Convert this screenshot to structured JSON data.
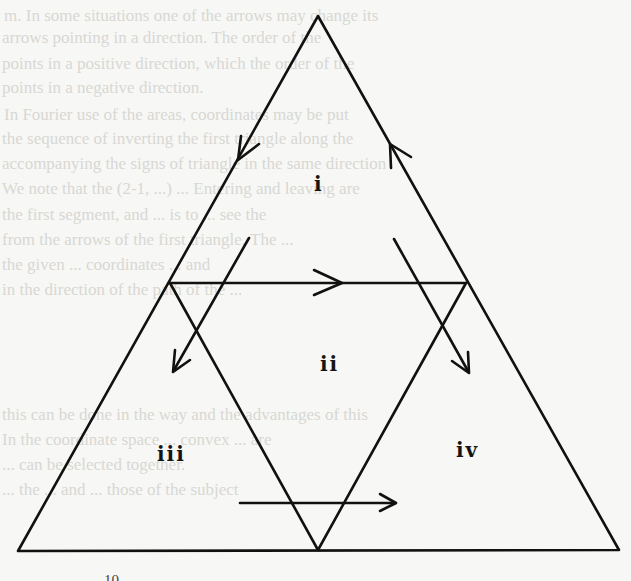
{
  "figure": {
    "type": "triangle-subdivision-diagram",
    "stroke_color": "#111111",
    "background_color": "#f7f7f5",
    "outer_triangle": {
      "apex": [
        318,
        16
      ],
      "bottom_left": [
        18,
        551
      ],
      "bottom_right": [
        619,
        550
      ]
    },
    "inner_points": {
      "left_mid": [
        170,
        283
      ],
      "right_mid": [
        466,
        283
      ],
      "bottom_mid": [
        318,
        550
      ]
    },
    "regions": [
      {
        "id": "i",
        "label": "i",
        "position": [
          314,
          174
        ]
      },
      {
        "id": "ii",
        "label": "ii",
        "position": [
          322,
          354
        ]
      },
      {
        "id": "iii",
        "label": "iii",
        "position": [
          157,
          444
        ]
      },
      {
        "id": "iv",
        "label": "iv",
        "position": [
          456,
          440
        ]
      }
    ],
    "arrows": [
      {
        "name": "left-side-arrow",
        "direction": "down-left",
        "tip": [
          238,
          160
        ]
      },
      {
        "name": "right-side-arrow",
        "direction": "up-left",
        "tip": [
          390,
          144
        ]
      },
      {
        "name": "midline-arrow",
        "direction": "right",
        "tip": [
          342,
          283
        ]
      },
      {
        "name": "left-diagonal-arrow",
        "direction": "down-left",
        "from": [
          249,
          238
        ],
        "to": [
          173,
          372
        ]
      },
      {
        "name": "right-diagonal-arrow",
        "direction": "down-right",
        "from": [
          394,
          239
        ],
        "to": [
          469,
          373
        ]
      },
      {
        "name": "bottom-arrow",
        "direction": "right",
        "from": [
          240,
          503
        ],
        "to": [
          396,
          503
        ]
      }
    ]
  },
  "page_number": "10",
  "bleed_through_text": [
    "m. In some situations one of the arrows may change its",
    "arrows pointing in a direction. The order of the",
    "points in a positive direction, which the order of the",
    "points in a negative direction.",
    "In Fourier use of the areas, coordinates may be put",
    "the sequence of inverting the first triangle along the",
    "accompanying the signs of triangle in the same direction",
    "We note that the (2-1, ...) ... Entering and leaving are",
    "the first segment, and ... is to ... see the",
    "from the arrows of the first triangle. The ...",
    "the given ... coordinates ... and",
    "in the direction of the path of the ...",
    "this can be done in the way and the advantages of this",
    "In the coordinate space ... convex ... are",
    "... can be selected together.",
    "... the ... and ... those of the subject"
  ]
}
